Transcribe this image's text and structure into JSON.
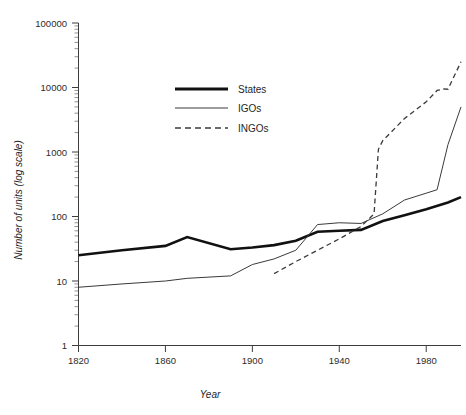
{
  "chart_data": {
    "type": "line",
    "title": "",
    "subtitle": "",
    "xlabel": "Year",
    "ylabel": "Number of units (log scale)",
    "yscale": "log",
    "xlim": [
      1820,
      1996
    ],
    "ylim": [
      1,
      100000
    ],
    "grid": false,
    "legend_position": "upper-left-inside",
    "x_ticks": [
      "1820",
      "1860",
      "1900",
      "1940",
      "1980"
    ],
    "x_tick_values": [
      1820,
      1860,
      1900,
      1940,
      1980
    ],
    "y_ticks": [
      "1",
      "10",
      "100",
      "1000",
      "10000",
      "100000"
    ],
    "y_tick_values": [
      1,
      10,
      100,
      1000,
      10000,
      100000
    ],
    "series": [
      {
        "name": "States",
        "style": "thick-solid",
        "color": "#111111",
        "x": [
          1820,
          1840,
          1860,
          1870,
          1890,
          1900,
          1910,
          1920,
          1930,
          1940,
          1950,
          1960,
          1970,
          1980,
          1990,
          1996
        ],
        "values": [
          25,
          30,
          35,
          48,
          31,
          33,
          36,
          42,
          58,
          60,
          62,
          85,
          105,
          130,
          165,
          200
        ]
      },
      {
        "name": "IGOs",
        "style": "thin-solid",
        "color": "#3a3a3a",
        "x": [
          1820,
          1840,
          1860,
          1870,
          1890,
          1900,
          1910,
          1920,
          1930,
          1940,
          1950,
          1960,
          1970,
          1980,
          1985,
          1990,
          1996
        ],
        "values": [
          8,
          9,
          10,
          11,
          12,
          18,
          22,
          30,
          75,
          80,
          78,
          110,
          180,
          230,
          260,
          1300,
          5000
        ]
      },
      {
        "name": "INGOs",
        "style": "dashed",
        "color": "#3a3a3a",
        "x": [
          1910,
          1920,
          1930,
          1940,
          1950,
          1956,
          1958,
          1960,
          1970,
          1980,
          1985,
          1988,
          1990,
          1996
        ],
        "values": [
          13,
          20,
          30,
          45,
          70,
          110,
          1100,
          1500,
          3300,
          6000,
          9000,
          9500,
          9400,
          25000
        ]
      }
    ]
  },
  "legend": {
    "entries": [
      {
        "label": "States",
        "key": "states"
      },
      {
        "label": "IGOs",
        "key": "igos"
      },
      {
        "label": "INGOs",
        "key": "ingos"
      }
    ]
  },
  "colors": {
    "states": "#111111",
    "igos": "#3a3a3a",
    "ingos": "#3a3a3a",
    "axis": "#3d3d3d",
    "background": "#ffffff"
  }
}
